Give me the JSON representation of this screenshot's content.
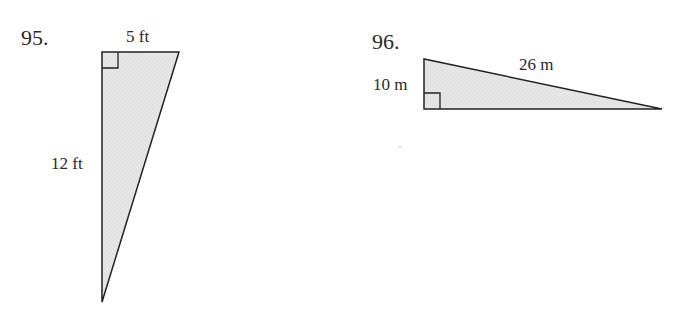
{
  "problems": [
    {
      "number": "95.",
      "shape": "right-triangle",
      "labels": {
        "top": "5 ft",
        "left": "12 ft"
      },
      "fill": "#e4e4e4",
      "stroke": "#222222"
    },
    {
      "number": "96.",
      "shape": "right-triangle",
      "labels": {
        "left": "10 m",
        "hypotenuse": "26 m"
      },
      "fill": "#e4e4e4",
      "stroke": "#222222"
    }
  ]
}
